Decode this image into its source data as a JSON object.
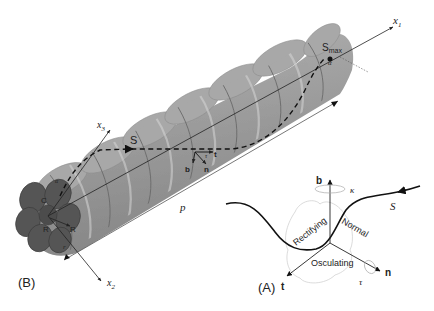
{
  "figure": {
    "panel_b": {
      "label": "(B)",
      "axes": {
        "x1": {
          "name": "x",
          "sub": "1"
        },
        "x2": {
          "name": "x",
          "sub": "2"
        },
        "x3": {
          "name": "x",
          "sub": "3"
        }
      },
      "curve_label": "S",
      "smax_label": {
        "name": "S",
        "sub": "max"
      },
      "pitch_label": "p",
      "frame_labels": {
        "t": "t",
        "b": "b",
        "n": "n"
      },
      "angle_labels": {
        "alpha_top": "α",
        "alpha_bottom": "α",
        "tau": "τ"
      },
      "section_labels": {
        "center": "C",
        "radius_a": "R",
        "radius_b": "R",
        "r": "r"
      }
    },
    "panel_a": {
      "label": "(A)",
      "vectors": {
        "b": "b",
        "n": "n",
        "t": "t"
      },
      "curve_label": "S",
      "kappa": "κ",
      "tau": "τ",
      "planes": {
        "rectifying": "Rectifying",
        "normal": "Normal",
        "osculating": "Osculating"
      }
    },
    "colors": {
      "rope": "#9a9a9a",
      "rope_dark": "#6e6e6e",
      "rope_light": "#c4c4c4",
      "end_face": "#5a5a5a",
      "ink": "#222222",
      "plane_outline": "#cccccc"
    }
  }
}
